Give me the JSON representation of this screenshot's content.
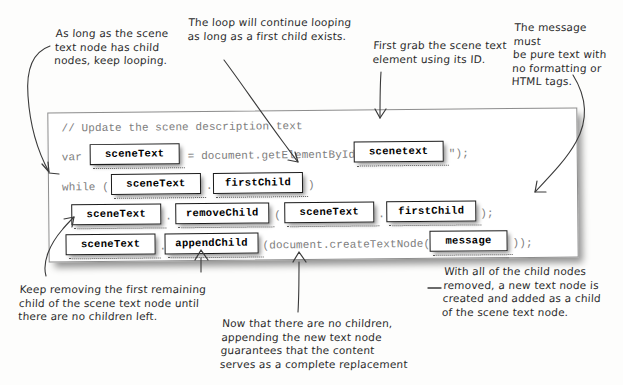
{
  "page": {
    "width": 623,
    "height": 385,
    "background": "#fdfdfc",
    "ink_color": "#2b2b2b"
  },
  "code_box": {
    "shadow_color": "#000000",
    "border_color": "#8d8d8d",
    "code_text_color": "#7d7d7d",
    "lines": [
      {
        "id": "comment",
        "text": "// Update the scene description text"
      },
      {
        "id": "var-line-a",
        "text": "var"
      },
      {
        "id": "var-line-b",
        "text": "= document.getElementById(\""
      },
      {
        "id": "var-line-c",
        "text": "\");"
      },
      {
        "id": "while-line-a",
        "text": "while ("
      },
      {
        "id": "while-line-b",
        "text": "."
      },
      {
        "id": "while-line-c",
        "text": ")"
      },
      {
        "id": "remove-line-a",
        "text": "."
      },
      {
        "id": "remove-line-b",
        "text": "("
      },
      {
        "id": "remove-line-c",
        "text": "."
      },
      {
        "id": "remove-line-d",
        "text": ");"
      },
      {
        "id": "append-line-a",
        "text": "."
      },
      {
        "id": "append-line-b",
        "text": "(document.createTextNode("
      },
      {
        "id": "append-line-c",
        "text": "));"
      }
    ],
    "tokens": [
      {
        "id": "tok-1",
        "label": "sceneText"
      },
      {
        "id": "tok-2",
        "label": "scenetext"
      },
      {
        "id": "tok-3",
        "label": "sceneText"
      },
      {
        "id": "tok-4",
        "label": "firstChild"
      },
      {
        "id": "tok-5",
        "label": "sceneText"
      },
      {
        "id": "tok-6",
        "label": "removeChild"
      },
      {
        "id": "tok-7",
        "label": "sceneText"
      },
      {
        "id": "tok-8",
        "label": "firstChild"
      },
      {
        "id": "tok-9",
        "label": "sceneText"
      },
      {
        "id": "tok-10",
        "label": "appendChild"
      },
      {
        "id": "tok-11",
        "label": "message"
      }
    ]
  },
  "annotations": [
    {
      "id": "annot-while-condition",
      "text": "As long as the scene\ntext node has child\nnodes, keep looping."
    },
    {
      "id": "annot-loop-continues",
      "text": "The loop will continue looping\nas long as a first child exists."
    },
    {
      "id": "annot-grab-element",
      "text": "First grab the scene text\nelement using its ID."
    },
    {
      "id": "annot-pure-text",
      "text": "The message must\nbe pure text with\nno formatting or\nHTML tags."
    },
    {
      "id": "annot-keep-removing",
      "text": "Keep removing the first remaining\nchild of the scene text node until\nthere are no children left."
    },
    {
      "id": "annot-no-children",
      "text": "Now that there are no children,\nappending the new text node\nguarantees that the content\nserves as a complete replacement"
    },
    {
      "id": "annot-new-text-node",
      "text": "With all of the child nodes\nremoved, a new text node is\ncreated and added as a child\nof the scene text node."
    }
  ]
}
